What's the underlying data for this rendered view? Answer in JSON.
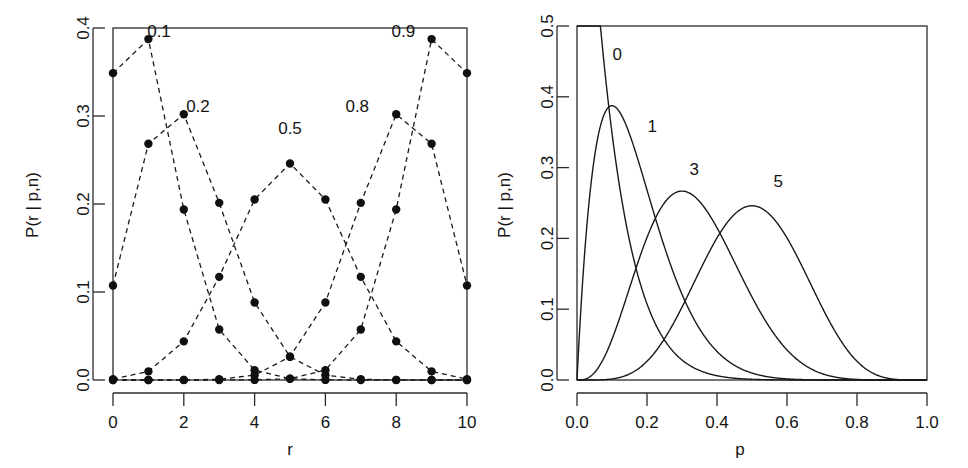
{
  "figure": {
    "panels": [
      {
        "id": "left",
        "name": "binomial-pmf-vs-r",
        "xlabel": "r",
        "ylabel": "P(r | p,n)",
        "x_ticks": [
          "0",
          "2",
          "4",
          "6",
          "8",
          "10"
        ],
        "y_ticks": [
          "0.0",
          "0.1",
          "0.2",
          "0.3",
          "0.4"
        ],
        "series_labels": [
          "0.1",
          "0.2",
          "0.5",
          "0.8",
          "0.9"
        ]
      },
      {
        "id": "right",
        "name": "binomial-likelihood-vs-p",
        "xlabel": "p",
        "ylabel": "P(r | p,n)",
        "x_ticks": [
          "0.0",
          "0.2",
          "0.4",
          "0.6",
          "0.8",
          "1.0"
        ],
        "y_ticks": [
          "0.0",
          "0.1",
          "0.2",
          "0.3",
          "0.4",
          "0.5"
        ],
        "series_labels": [
          "0",
          "1",
          "3",
          "5"
        ]
      }
    ],
    "colors": {
      "line": "#1a1a1a",
      "axis": "#2b2b2b",
      "background": "#ffffff",
      "point": "#101010"
    }
  },
  "chart_data": [
    {
      "type": "scatter",
      "name": "binomial-pmf-vs-r",
      "title": "",
      "xlabel": "r",
      "ylabel": "P(r | p,n)",
      "xlim": [
        0,
        10
      ],
      "ylim": [
        0,
        0.4
      ],
      "x_ticks": [
        0,
        2,
        4,
        6,
        8,
        10
      ],
      "y_ticks": [
        0.0,
        0.1,
        0.2,
        0.3,
        0.4
      ],
      "grid": false,
      "legend": "inline-labels",
      "line_style": "dashed-with-points",
      "n": 10,
      "x": [
        0,
        1,
        2,
        3,
        4,
        5,
        6,
        7,
        8,
        9,
        10
      ],
      "series": [
        {
          "name": "0.1",
          "p": 0.1,
          "values": [
            0.3487,
            0.3874,
            0.1937,
            0.0574,
            0.0112,
            0.0015,
            0.0001,
            0.0,
            0.0,
            0.0,
            0.0
          ]
        },
        {
          "name": "0.2",
          "p": 0.2,
          "values": [
            0.1074,
            0.2684,
            0.302,
            0.2013,
            0.0881,
            0.0264,
            0.0055,
            0.0008,
            0.0001,
            0.0,
            0.0
          ]
        },
        {
          "name": "0.5",
          "p": 0.5,
          "values": [
            0.001,
            0.0098,
            0.0439,
            0.1172,
            0.2051,
            0.2461,
            0.2051,
            0.1172,
            0.0439,
            0.0098,
            0.001
          ]
        },
        {
          "name": "0.8",
          "p": 0.8,
          "values": [
            0.0,
            0.0,
            0.0001,
            0.0008,
            0.0055,
            0.0264,
            0.0881,
            0.2013,
            0.302,
            0.2684,
            0.1074
          ]
        },
        {
          "name": "0.9",
          "p": 0.9,
          "values": [
            0.0,
            0.0,
            0.0,
            0.0,
            0.0001,
            0.0015,
            0.0112,
            0.0574,
            0.1937,
            0.3874,
            0.3487
          ]
        }
      ],
      "annotations": [
        {
          "text": "0.1",
          "x": 1.3,
          "y": 0.385
        },
        {
          "text": "0.2",
          "x": 2.4,
          "y": 0.3
        },
        {
          "text": "0.5",
          "x": 5.0,
          "y": 0.275
        },
        {
          "text": "0.8",
          "x": 6.9,
          "y": 0.3
        },
        {
          "text": "0.9",
          "x": 8.2,
          "y": 0.385
        }
      ]
    },
    {
      "type": "line",
      "name": "binomial-likelihood-vs-p",
      "title": "",
      "xlabel": "p",
      "ylabel": "P(r | p,n)",
      "xlim": [
        0,
        1
      ],
      "ylim": [
        0,
        0.5
      ],
      "x_ticks": [
        0.0,
        0.2,
        0.4,
        0.6,
        0.8,
        1.0
      ],
      "y_ticks": [
        0.0,
        0.1,
        0.2,
        0.3,
        0.4,
        0.5
      ],
      "grid": false,
      "legend": "inline-labels",
      "line_style": "solid",
      "n": 10,
      "series": [
        {
          "name": "0",
          "r": 0,
          "peak_p": 0.0,
          "peak_value": 1.0
        },
        {
          "name": "1",
          "r": 1,
          "peak_p": 0.1,
          "peak_value": 0.3874
        },
        {
          "name": "3",
          "r": 3,
          "peak_p": 0.3,
          "peak_value": 0.2668
        },
        {
          "name": "5",
          "r": 5,
          "peak_p": 0.5,
          "peak_value": 0.2461
        }
      ],
      "annotations": [
        {
          "text": "0",
          "x": 0.115,
          "y": 0.452
        },
        {
          "text": "1",
          "x": 0.215,
          "y": 0.35
        },
        {
          "text": "3",
          "x": 0.335,
          "y": 0.29
        },
        {
          "text": "5",
          "x": 0.575,
          "y": 0.272
        }
      ]
    }
  ]
}
